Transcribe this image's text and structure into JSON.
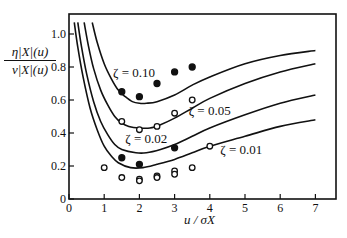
{
  "chart_data": {
    "type": "line",
    "title": "",
    "xlabel": "u / σ_X",
    "ylabel": "η_|X|(u) / ν_|X|(u)",
    "ylabel_num": "η|X|(u)",
    "ylabel_den": "ν|X|(u)",
    "xlabel_text": "u / σX",
    "xlim": [
      0,
      7.6
    ],
    "ylim": [
      0,
      1.12
    ],
    "xticks": [
      0,
      1,
      2,
      3,
      4,
      5,
      6,
      7
    ],
    "yticks": [
      0,
      0.2,
      0.4,
      0.6,
      0.8,
      1.0
    ],
    "ytick_labels": [
      "0",
      "0.2",
      "0.4",
      "0.6",
      "0.8",
      "1.0"
    ],
    "grid": false,
    "legend": "inline annotations",
    "series": [
      {
        "name": "ζ = 0.10",
        "kind": "curve",
        "x": [
          0.66,
          0.8,
          1.0,
          1.2,
          1.4,
          1.6,
          1.8,
          2.0,
          2.2,
          2.5,
          3.0,
          3.5,
          4.0,
          5.0,
          6.0,
          7.0
        ],
        "y": [
          1.07,
          0.95,
          0.82,
          0.73,
          0.66,
          0.62,
          0.59,
          0.58,
          0.58,
          0.59,
          0.63,
          0.69,
          0.74,
          0.82,
          0.87,
          0.9
        ]
      },
      {
        "name": "ζ = 0.05",
        "kind": "curve",
        "x": [
          0.43,
          0.55,
          0.7,
          0.9,
          1.1,
          1.3,
          1.5,
          1.7,
          2.0,
          2.3,
          2.6,
          3.0,
          3.5,
          4.0,
          5.0,
          6.0,
          7.0
        ],
        "y": [
          1.07,
          0.93,
          0.79,
          0.66,
          0.57,
          0.5,
          0.46,
          0.44,
          0.43,
          0.43,
          0.45,
          0.49,
          0.55,
          0.61,
          0.7,
          0.77,
          0.82
        ]
      },
      {
        "name": "ζ = 0.02",
        "kind": "curve",
        "x": [
          0.25,
          0.35,
          0.5,
          0.7,
          0.9,
          1.1,
          1.3,
          1.5,
          1.9,
          2.2,
          2.6,
          3.0,
          3.5,
          4.0,
          5.0,
          6.0,
          7.0
        ],
        "y": [
          1.07,
          0.93,
          0.76,
          0.59,
          0.47,
          0.39,
          0.33,
          0.3,
          0.28,
          0.28,
          0.3,
          0.33,
          0.38,
          0.43,
          0.51,
          0.58,
          0.63
        ]
      },
      {
        "name": "ζ = 0.01",
        "kind": "curve",
        "x": [
          0.15,
          0.25,
          0.4,
          0.6,
          0.8,
          1.0,
          1.2,
          1.4,
          1.75,
          2.1,
          2.5,
          3.0,
          3.5,
          4.0,
          5.0,
          6.0,
          7.0
        ],
        "y": [
          1.07,
          0.92,
          0.74,
          0.55,
          0.42,
          0.32,
          0.26,
          0.22,
          0.19,
          0.19,
          0.21,
          0.24,
          0.28,
          0.32,
          0.38,
          0.44,
          0.48
        ]
      },
      {
        "name": "data filled (ζ=0.10)",
        "kind": "scatter-filled",
        "x": [
          1.5,
          2.0,
          2.5,
          3.0,
          3.5
        ],
        "y": [
          0.65,
          0.62,
          0.7,
          0.77,
          0.8
        ]
      },
      {
        "name": "data open (ζ=0.05)",
        "kind": "scatter-open",
        "x": [
          1.5,
          2.0,
          2.5,
          3.0,
          3.5
        ],
        "y": [
          0.47,
          0.42,
          0.44,
          0.52,
          0.6
        ]
      },
      {
        "name": "data filled (ζ=0.02)",
        "kind": "scatter-filled",
        "x": [
          1.5,
          2.0,
          3.0
        ],
        "y": [
          0.25,
          0.21,
          0.31
        ]
      },
      {
        "name": "data open (ζ=0.01)",
        "kind": "scatter-open",
        "x": [
          1.0,
          1.5,
          2.0,
          2.0,
          2.5,
          2.5,
          3.0,
          3.0,
          3.5,
          4.0
        ],
        "y": [
          0.19,
          0.13,
          0.12,
          0.11,
          0.14,
          0.13,
          0.17,
          0.15,
          0.19,
          0.32
        ]
      }
    ],
    "annotations": [
      {
        "text": "ζ = 0.10",
        "x": 1.25,
        "y": 0.74
      },
      {
        "text": "ζ = 0.05",
        "x": 3.4,
        "y": 0.51
      },
      {
        "text": "ζ = 0.02",
        "x": 1.6,
        "y": 0.34
      },
      {
        "text": "ζ = 0.01",
        "x": 4.3,
        "y": 0.27
      }
    ]
  }
}
